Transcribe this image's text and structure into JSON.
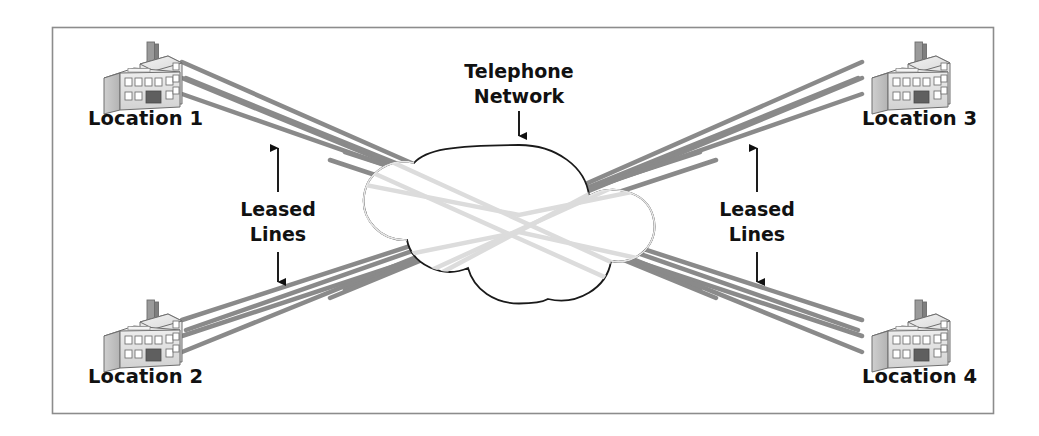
{
  "figure": {
    "kind": "network-diagram",
    "title_visible": false,
    "background_color": "#ffffff",
    "frame": {
      "color": "#8c8c8c",
      "x": 52,
      "y": 27,
      "width": 942,
      "height": 387
    }
  },
  "palette": {
    "line_gray": "#8a8a8a",
    "line_gray_behind_cloud": "#dcdcdc",
    "cloud_outline": "#1a1a1a",
    "cloud_fill": "#ffffff",
    "cloud_inner_hint": "#ededed",
    "text_black": "#111111",
    "arrow_black": "#111111",
    "building_light": "#e3e3e3",
    "building_mid": "#c9c9c9",
    "building_dark": "#9a9a9a",
    "building_outline": "#6e6e6e",
    "building_door": "#5f5f5f"
  },
  "nodes": [
    {
      "id": "loc1",
      "label": "Location 1",
      "position": "top-left",
      "icon": "factory-building-icon",
      "icon_x": 100,
      "icon_y": 42,
      "label_x": 88,
      "label_y": 125
    },
    {
      "id": "loc2",
      "label": "Location 2",
      "position": "bottom-left",
      "icon": "factory-building-icon",
      "icon_x": 100,
      "icon_y": 300,
      "label_x": 88,
      "label_y": 383
    },
    {
      "id": "loc3",
      "label": "Location 3",
      "position": "top-right",
      "icon": "factory-building-icon",
      "icon_x": 868,
      "icon_y": 42,
      "label_x": 862,
      "label_y": 125
    },
    {
      "id": "loc4",
      "label": "Location 4",
      "position": "bottom-right",
      "icon": "factory-building-icon",
      "icon_x": 868,
      "icon_y": 300,
      "label_x": 862,
      "label_y": 383
    }
  ],
  "cloud": {
    "id": "telephone-network",
    "label_line1": "Telephone",
    "label_line2": "Network",
    "label_x": 519,
    "label_line1_y": 78,
    "label_line2_y": 103,
    "pointer_arrow": {
      "from_y": 110,
      "to_y": 143,
      "x": 519,
      "direction": "down"
    },
    "center_x": 519,
    "center_y": 223,
    "top_y": 145,
    "bottom_y": 303,
    "left_x": 382,
    "right_x": 657
  },
  "annotations": [
    {
      "id": "leased-lines-left",
      "line1": "Leased",
      "line2": "Lines",
      "x": 278,
      "line1_y": 212,
      "line2_y": 240,
      "arrow": {
        "x": 278,
        "top_y": 140,
        "bottom_y": 288,
        "heads": "both"
      }
    },
    {
      "id": "leased-lines-right",
      "line1": "Leased",
      "line2": "Lines",
      "x": 757,
      "line1_y": 212,
      "line2_y": 240,
      "arrow": {
        "x": 757,
        "top_y": 140,
        "bottom_y": 288,
        "heads": "both"
      }
    }
  ],
  "links": {
    "description": "Three leased lines fan out from each location and cross through the telephone network cloud.",
    "stroke_width": 4.5,
    "groups": [
      {
        "from": "loc1",
        "bundle": 3,
        "direction": "down-right"
      },
      {
        "from": "loc2",
        "bundle": 3,
        "direction": "up-right"
      },
      {
        "from": "loc3",
        "bundle": 3,
        "direction": "down-left"
      },
      {
        "from": "loc4",
        "bundle": 3,
        "direction": "up-left"
      }
    ]
  }
}
